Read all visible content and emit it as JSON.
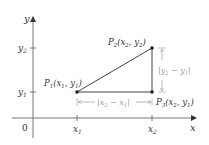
{
  "axes": {
    "x_label": "x",
    "y_label": "y",
    "origin_label": "0",
    "x_ticks": [
      "x1",
      "x2"
    ],
    "y_ticks": [
      "y1",
      "y2"
    ]
  },
  "points": {
    "p1": {
      "name": "P",
      "sub": "1",
      "coords": "(x1, y1)"
    },
    "p2": {
      "name": "P",
      "sub": "2",
      "coords": "(x2, y2)"
    },
    "p3": {
      "name": "P",
      "sub": "3",
      "coords": "(x2, y1)"
    }
  },
  "dimensions": {
    "horizontal": "|x2 − x1|",
    "vertical": "|y2 − y1|"
  },
  "colors": {
    "axis": "#555555",
    "line": "#444444",
    "dimension": "#9a9a9a",
    "text": "#333333"
  }
}
